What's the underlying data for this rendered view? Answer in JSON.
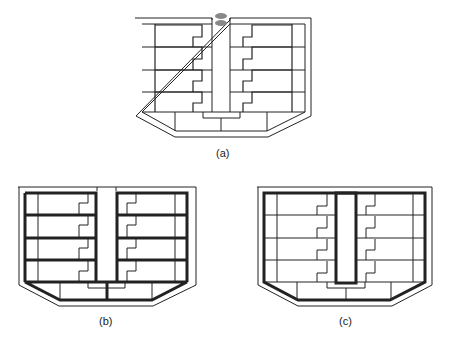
{
  "figure": {
    "panels": [
      {
        "id": "a",
        "label": "(a)",
        "description": "Floor plan with central corridor; thin lines; stair notch at top"
      },
      {
        "id": "b",
        "label": "(b)",
        "description": "Floor plan with thick lines on floor divisions and corridor walls"
      },
      {
        "id": "c",
        "label": "(c)",
        "description": "Floor plan with thick perimeter and thick central core outline"
      }
    ]
  },
  "colors": {
    "line": "#1a1a1a",
    "thin": "#555555",
    "background": "#ffffff"
  }
}
